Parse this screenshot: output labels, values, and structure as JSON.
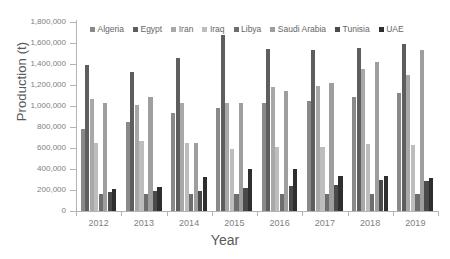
{
  "chart_data": {
    "type": "bar",
    "title": "",
    "xlabel": "Year",
    "ylabel": "Production (t)",
    "categories": [
      "2012",
      "2013",
      "2014",
      "2015",
      "2016",
      "2017",
      "2018",
      "2019"
    ],
    "ylim": [
      0,
      1800000
    ],
    "ytick_values": [
      0,
      200000,
      400000,
      600000,
      800000,
      1000000,
      1200000,
      1400000,
      1600000,
      1800000
    ],
    "ytick_labels": [
      "0",
      "200,000",
      "400,000",
      "600,000",
      "800,000",
      "1,000,000",
      "1,200,000",
      "1,400,000",
      "1,600,000",
      "1,800,000"
    ],
    "grid": false,
    "legend_position": "top-center",
    "series": [
      {
        "name": "Algeria",
        "color": "#898989",
        "values": [
          785000,
          845000,
          930000,
          985000,
          1025000,
          1050000,
          1085000,
          1125000
        ]
      },
      {
        "name": "Egypt",
        "color": "#5e5e5e",
        "values": [
          1395000,
          1320000,
          1460000,
          1680000,
          1540000,
          1535000,
          1555000,
          1595000
        ]
      },
      {
        "name": "Iran",
        "color": "#a8a8a8",
        "values": [
          1065000,
          1010000,
          1030000,
          1030000,
          1180000,
          1190000,
          1350000,
          1300000
        ]
      },
      {
        "name": "Iraq",
        "color": "#bdbdbd",
        "values": [
          650000,
          670000,
          650000,
          595000,
          605000,
          610000,
          635000,
          630000
        ]
      },
      {
        "name": "Libya",
        "color": "#6e6e6e",
        "values": [
          160000,
          160000,
          160000,
          165000,
          160000,
          160000,
          165000,
          165000
        ]
      },
      {
        "name": "Saudi Arabia",
        "color": "#9e9e9e",
        "values": [
          1025000,
          1090000,
          645000,
          1030000,
          1145000,
          1215000,
          1415000,
          1535000
        ]
      },
      {
        "name": "Tunisia",
        "color": "#4a4a4a",
        "values": [
          185000,
          190000,
          192000,
          215000,
          235000,
          250000,
          300000,
          285000
        ]
      },
      {
        "name": "UAE",
        "color": "#2e2e2e",
        "values": [
          213000,
          230000,
          320000,
          398000,
          403000,
          335000,
          337000,
          312000
        ]
      }
    ]
  }
}
